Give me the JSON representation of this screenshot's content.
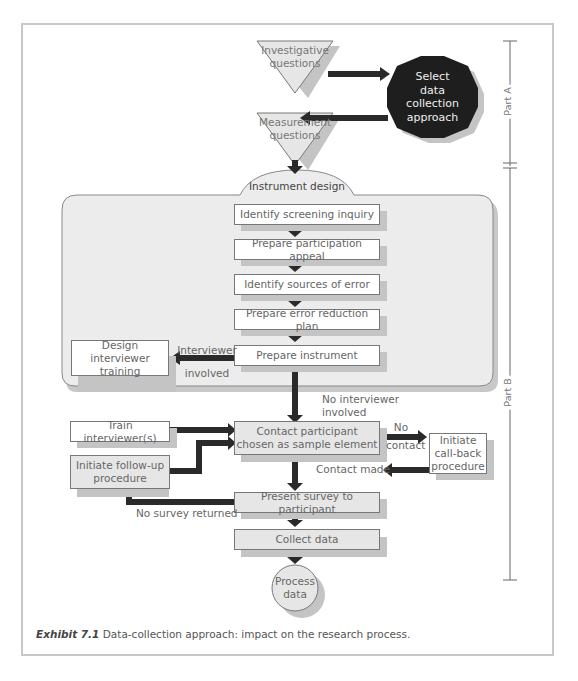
{
  "diagram": {
    "part_markers": [
      {
        "label": "Part A"
      },
      {
        "label": "Part B"
      }
    ],
    "part_a": {
      "investigative_questions": "Investigative questions",
      "investigative_questions_lines": [
        "Investigative",
        "questions"
      ],
      "select_approach_lines": [
        "Select",
        "data",
        "collection",
        "approach"
      ],
      "measurement_questions_lines": [
        "Measurement",
        "questions"
      ]
    },
    "instrument_design": {
      "title": "Instrument design",
      "steps": [
        "Identify screening inquiry",
        "Prepare participation appeal",
        "Identify sources of error",
        "Prepare error reduction plan",
        "Prepare instrument"
      ],
      "branch_label_lines": [
        "Interviewer",
        "involved"
      ],
      "branch_target_lines": [
        "Design interviewer",
        "training"
      ]
    },
    "fieldwork": {
      "no_interviewer_lines": [
        "No interviewer",
        "involved"
      ],
      "train_interviewers": "Train interviewer(s)",
      "contact_participant_lines": [
        "Contact participant",
        "chosen as sample element"
      ],
      "no_contact_lines": [
        "No",
        "contact"
      ],
      "callback_lines": [
        "Initiate",
        "call-back",
        "procedure"
      ],
      "contact_made": "Contact made",
      "follow_up_lines": [
        "Initiate follow-up",
        "procedure"
      ],
      "present_survey": "Present survey to participant",
      "no_survey_returned": "No survey returned",
      "collect_data": "Collect data",
      "process_data_lines": [
        "Process",
        "data"
      ]
    },
    "colors": {
      "arrow": "#2a2a2a",
      "octagon": "#1e1e1e",
      "grey_fill": "#e6e6e6",
      "panel_fill": "#ececec",
      "shadow": "#c4c4c4",
      "frame_border": "#c8c8c8"
    }
  },
  "caption": {
    "label": "Exhibit 7.1",
    "text": " Data-collection approach: impact on the research process."
  },
  "below_fragment": "...the question and selection of the..."
}
